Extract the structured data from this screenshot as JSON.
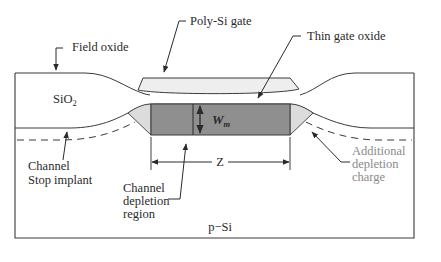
{
  "diagram": {
    "type": "MOSFET cross-section (width direction)",
    "colors": {
      "outline": "#3a3a3a",
      "poly_gate_fill": "#eeeeee",
      "depletion_fill": "#8f8f8f",
      "additional_depletion_fill": "#dcdcdc",
      "gray_text": "#8a8a8a"
    },
    "labels": {
      "field_oxide": "Field oxide",
      "poly_gate": "Poly-Si gate",
      "thin_gate_oxide": "Thin gate oxide",
      "sio2_main": "SiO",
      "sio2_sub": "2",
      "wm_main": "W",
      "wm_sub": "m",
      "z": "Z",
      "channel_stop_line1": "Channel",
      "channel_stop_line2": "Stop implant",
      "channel_depletion_line1": "Channel",
      "channel_depletion_line2": "depletion",
      "channel_depletion_line3": "region",
      "additional_line1": "Additional",
      "additional_line2": "depletion",
      "additional_line3": "charge",
      "substrate": "p−Si"
    }
  }
}
